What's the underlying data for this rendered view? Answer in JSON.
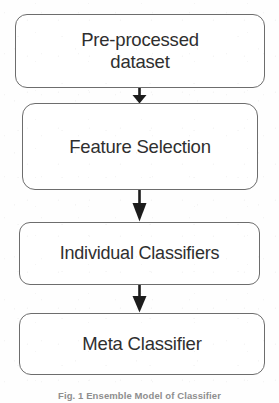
{
  "figure": {
    "type": "flowchart",
    "orientation": "vertical-top-to-bottom",
    "background_color": "#ffffff",
    "border_color": "#6d6d6d",
    "text_color": "#2f2f2f",
    "arrow_color": "#1c1c1c",
    "nodes": [
      {
        "id": "pre-processed-dataset",
        "label": "Pre-processed\ndataset"
      },
      {
        "id": "feature-selection",
        "label": "Feature Selection"
      },
      {
        "id": "individual-classifiers",
        "label": "Individual Classifiers"
      },
      {
        "id": "meta-classifier",
        "label": "Meta Classifier"
      }
    ],
    "edges": [
      {
        "id": "edge-0",
        "from": "pre-processed-dataset",
        "to": "feature-selection"
      },
      {
        "id": "edge-1",
        "from": "feature-selection",
        "to": "individual-classifiers"
      },
      {
        "id": "edge-2",
        "from": "individual-classifiers",
        "to": "meta-classifier"
      }
    ],
    "caption": "Fig. 1 Ensemble Model of Classifier"
  }
}
